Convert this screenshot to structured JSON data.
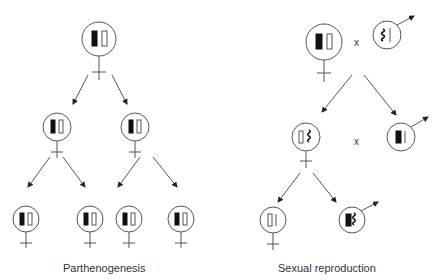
{
  "panels": [
    {
      "id": "left",
      "caption": "Parthenogenesis"
    },
    {
      "id": "right",
      "caption": "Sexual reproduction"
    }
  ],
  "cross_symbol": "x",
  "legend": {
    "female_symbol": "female-symbol-icon",
    "male_symbol": "male-symbol-icon",
    "chromosome_filled": "black bar",
    "chromosome_open": "open bar",
    "chromosome_wavy": "wavy chromosome",
    "chromosome_thin": "thin line chromosome"
  },
  "colors": {
    "stroke": "#555555",
    "fill": "#111111",
    "background": "#ffffff"
  }
}
